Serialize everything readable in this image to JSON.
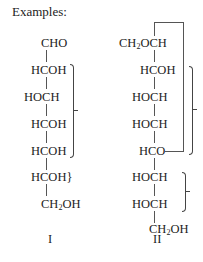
{
  "heading": "Examples:",
  "structure_I": {
    "label": "I",
    "rows": [
      "CHO",
      "HCOH",
      "HOCH",
      "HCOH",
      "HCOH",
      "HCOH}",
      "CH2OH"
    ]
  },
  "structure_II": {
    "label": "II",
    "rows": [
      "CH2OCH",
      "HCOH",
      "HOCH",
      "HOCH",
      "HCO",
      "HOCH",
      "HOCH",
      "CH2OH"
    ]
  }
}
